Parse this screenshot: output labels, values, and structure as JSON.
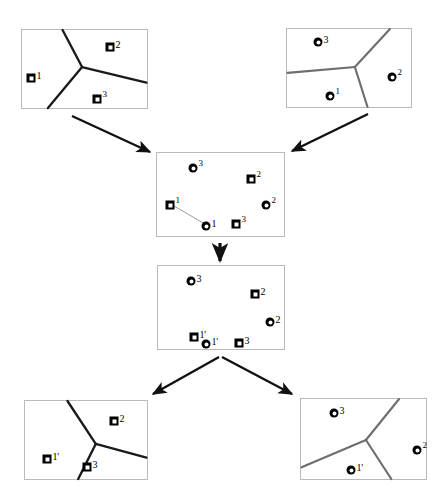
{
  "figure": {
    "width": 446,
    "height": 499,
    "background": "#ffffff",
    "line_color_dark": "#1a1a1a",
    "line_color_gray": "#6e6e6e",
    "panel_border_color": "#b9b9b9",
    "marker_color": "#000000",
    "arrow_color": "#111111"
  },
  "panels": [
    {
      "id": "top-left",
      "name": "source-squares-voronoi",
      "x": 21,
      "y": 29,
      "w": 127,
      "h": 80,
      "marker_shape": "square",
      "line_color": "#1a1a1a",
      "line_width": 2.4,
      "junction": {
        "x": 61,
        "y": 38
      },
      "edges": [
        {
          "to_x": 41,
          "to_y": 0
        },
        {
          "to_x": 26,
          "to_y": 80
        },
        {
          "to_x": 127,
          "to_y": 54
        }
      ],
      "markers": [
        {
          "label": "1",
          "x": 9,
          "y": 48,
          "sup": false
        },
        {
          "label": "2",
          "x": 88,
          "y": 17,
          "sup": false
        },
        {
          "label": "3",
          "x": 75,
          "y": 69,
          "sup": true
        }
      ]
    },
    {
      "id": "top-right",
      "name": "source-circles-voronoi",
      "x": 286,
      "y": 28,
      "w": 126,
      "h": 80,
      "marker_shape": "circle",
      "line_color": "#6e6e6e",
      "line_width": 2.2,
      "junction": {
        "x": 69,
        "y": 39
      },
      "edges": [
        {
          "to_x": 105,
          "to_y": 0
        },
        {
          "to_x": 0,
          "to_y": 45
        },
        {
          "to_x": 82,
          "to_y": 80
        }
      ],
      "markers": [
        {
          "label": "3",
          "x": 31,
          "y": 13,
          "sup": false
        },
        {
          "label": "2",
          "x": 105,
          "y": 48,
          "sup": true
        },
        {
          "label": "1",
          "x": 43,
          "y": 67,
          "sup": true
        }
      ]
    },
    {
      "id": "middle-upper",
      "name": "combined-unregistered",
      "x": 156,
      "y": 152,
      "w": 129,
      "h": 85,
      "marker_shape": "mixed",
      "line_color": "#9a9a9a",
      "line_width": 1.0,
      "junction": null,
      "edges": [],
      "correspondence": {
        "from_x": 13,
        "from_y": 52,
        "to_x": 49,
        "to_y": 73
      },
      "markers": [
        {
          "shape": "circle",
          "label": "3",
          "x": 36,
          "y": 15,
          "sup": true
        },
        {
          "shape": "square",
          "label": "2",
          "x": 94,
          "y": 26,
          "sup": true
        },
        {
          "shape": "square",
          "label": "1",
          "x": 13,
          "y": 52,
          "sup": true
        },
        {
          "shape": "circle",
          "label": "2",
          "x": 109,
          "y": 52,
          "sup": true
        },
        {
          "shape": "circle",
          "label": "1",
          "x": 49,
          "y": 73,
          "sup": false
        },
        {
          "shape": "square",
          "label": "3",
          "x": 79,
          "y": 71,
          "sup": true
        }
      ]
    },
    {
      "id": "middle-lower",
      "name": "combined-registered",
      "x": 157,
      "y": 265,
      "w": 128,
      "h": 85,
      "marker_shape": "mixed",
      "line_color": "#9a9a9a",
      "line_width": 1.0,
      "junction": null,
      "edges": [],
      "correspondence": null,
      "markers": [
        {
          "shape": "circle",
          "label": "3",
          "x": 33,
          "y": 15,
          "sup": false
        },
        {
          "shape": "square",
          "label": "2",
          "x": 97,
          "y": 28,
          "sup": false
        },
        {
          "shape": "circle",
          "label": "2",
          "x": 112,
          "y": 56,
          "sup": false
        },
        {
          "shape": "square",
          "label": "1'",
          "x": 36,
          "y": 71,
          "sup": false
        },
        {
          "shape": "circle",
          "label": "1'",
          "x": 48,
          "y": 78,
          "sup": false
        },
        {
          "shape": "square",
          "label": "3",
          "x": 81,
          "y": 77,
          "sup": false
        }
      ]
    },
    {
      "id": "bottom-left",
      "name": "result-squares-voronoi",
      "x": 24,
      "y": 400,
      "w": 124,
      "h": 80,
      "marker_shape": "square",
      "line_color": "#1a1a1a",
      "line_width": 2.4,
      "junction": {
        "x": 72,
        "y": 44
      },
      "edges": [
        {
          "to_x": 43,
          "to_y": 0
        },
        {
          "to_x": 54,
          "to_y": 80
        },
        {
          "to_x": 124,
          "to_y": 58
        }
      ],
      "markers": [
        {
          "label": "2",
          "x": 89,
          "y": 20,
          "sup": false
        },
        {
          "label": "1'",
          "x": 22,
          "y": 58,
          "sup": false
        },
        {
          "label": "3",
          "x": 62,
          "y": 66,
          "sup": false
        }
      ]
    },
    {
      "id": "bottom-right",
      "name": "result-circles-voronoi",
      "x": 300,
      "y": 398,
      "w": 127,
      "h": 82,
      "marker_shape": "circle",
      "line_color": "#6e6e6e",
      "line_width": 2.2,
      "junction": {
        "x": 66,
        "y": 42
      },
      "edges": [
        {
          "to_x": 100,
          "to_y": 0
        },
        {
          "to_x": 0,
          "to_y": 70
        },
        {
          "to_x": 92,
          "to_y": 82
        }
      ],
      "markers": [
        {
          "label": "3",
          "x": 33,
          "y": 14,
          "sup": false
        },
        {
          "label": "2",
          "x": 116,
          "y": 51,
          "sup": true
        },
        {
          "label": "1'",
          "x": 50,
          "y": 71,
          "sup": false
        }
      ]
    }
  ],
  "arrows": [
    {
      "name": "arrow-top-left-to-middle",
      "x1": 72,
      "y1": 116,
      "x2": 150,
      "y2": 152
    },
    {
      "name": "arrow-top-right-to-middle",
      "x1": 368,
      "y1": 114,
      "x2": 292,
      "y2": 151
    },
    {
      "name": "arrow-middle-upper-to-lower",
      "x1": 220,
      "y1": 243,
      "x2": 220,
      "y2": 261
    },
    {
      "name": "arrow-middle-to-bottom-left",
      "x1": 219,
      "y1": 357,
      "x2": 153,
      "y2": 394
    },
    {
      "name": "arrow-middle-to-bottom-right",
      "x1": 222,
      "y1": 357,
      "x2": 292,
      "y2": 394
    }
  ]
}
